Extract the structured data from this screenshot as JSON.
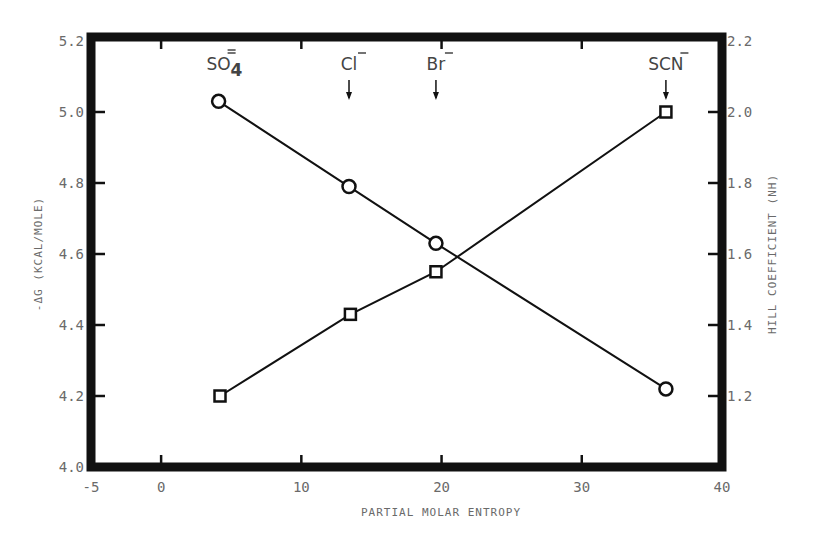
{
  "chart_data": {
    "type": "line",
    "title": "",
    "xlabel": "Partial Molar Entropy",
    "ylabel": "-ΔG (kcal/mole)",
    "y2label": "Hill Coefficient (nH)",
    "xlim": [
      -5,
      40
    ],
    "ylim": [
      4.0,
      5.2
    ],
    "y2lim": [
      1.0,
      2.2
    ],
    "x_ticks": [
      "-5",
      "0",
      "10",
      "20",
      "30",
      "40"
    ],
    "y_ticks": [
      "4.0",
      "4.2",
      "4.4",
      "4.6",
      "4.8",
      "5.0",
      "5.2"
    ],
    "y2_ticks": [
      "1.2",
      "1.4",
      "1.6",
      "1.8",
      "2.0",
      "2.2"
    ],
    "grid": false,
    "legend": null,
    "annotations": [
      {
        "text": "SO4=",
        "base": "SO",
        "sub": "4",
        "sup": "=",
        "x": 4.1,
        "arrow": false
      },
      {
        "text": "Cl-",
        "base": "Cl",
        "sup": "-",
        "x": 13.4,
        "arrow": true
      },
      {
        "text": "Br-",
        "base": "Br",
        "sup": "-",
        "x": 19.6,
        "arrow": true
      },
      {
        "text": "SCN-",
        "base": "SCN",
        "sup": "-",
        "x": 36.0,
        "arrow": true
      }
    ],
    "series": [
      {
        "name": "-ΔG",
        "axis": "left",
        "marker": "circle",
        "x": [
          4.1,
          13.4,
          19.6,
          36.0
        ],
        "values": [
          5.03,
          4.79,
          4.63,
          4.22
        ]
      },
      {
        "name": "Hill Coefficient",
        "axis": "right",
        "marker": "square",
        "x": [
          4.2,
          13.5,
          19.6,
          36.0
        ],
        "values": [
          1.2,
          1.43,
          1.55,
          2.0
        ]
      }
    ]
  },
  "labels": {
    "xlabel_display": "PARTIAL MOLAR ENTROPY",
    "ylabel_display": "-ΔG (KCAL/MOLE)",
    "y2label_display": "HILL COEFFICIENT (NH)"
  },
  "colors": {
    "ink": "#111111",
    "label": "#6a6a6a"
  }
}
